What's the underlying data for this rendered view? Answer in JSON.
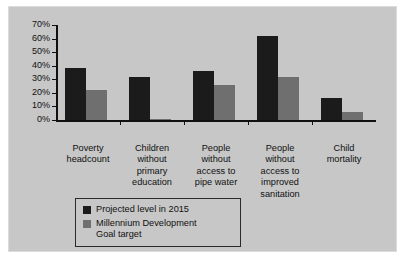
{
  "chart_data": {
    "type": "bar",
    "title": "",
    "subtitle": "",
    "xlabel": "",
    "ylabel": "",
    "ylim": [
      0,
      70
    ],
    "grid": false,
    "legend_position": "bottom-left",
    "ytick_labels": [
      "70%",
      "60%",
      "50%",
      "40%",
      "30%",
      "20%",
      "10%",
      "0%"
    ],
    "ytick_values": [
      70,
      60,
      50,
      40,
      30,
      20,
      10,
      0
    ],
    "categories": [
      "Poverty\nheadcount",
      "Children\nwithout\nprimary\neducation",
      "People\nwithout\naccess to\npipe water",
      "People\nwithout\naccess to\nimproved\nsanitation",
      "Child\nmortality"
    ],
    "series": [
      {
        "name": "Projected level in 2015",
        "color": "#1b1b1b",
        "values": [
          38,
          32,
          36,
          62,
          16
        ]
      },
      {
        "name": "Millennium Development\nGoal target",
        "color": "#6f6f6f",
        "values": [
          22,
          1,
          26,
          32,
          6
        ]
      }
    ]
  },
  "colors": {
    "background": "#c7c7c7",
    "page": "#ffffff",
    "axis": "#101010",
    "text": "#101010",
    "projected": "#1b1b1b",
    "target": "#6f6f6f"
  }
}
